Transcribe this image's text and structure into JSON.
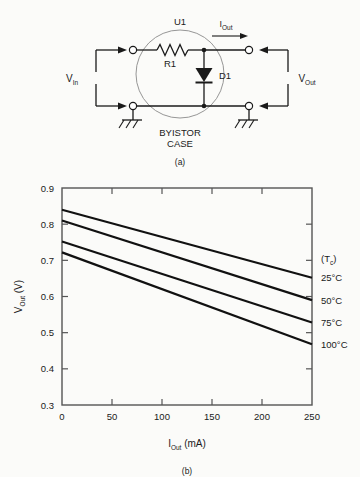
{
  "figure_a": {
    "caption": "(a)",
    "device_label": "U1",
    "case_label_line1": "BYISTOR",
    "case_label_line2": "CASE",
    "resistor_label": "R1",
    "diode_label": "D1",
    "input_label": "V",
    "input_sub": "In",
    "output_label": "V",
    "output_sub": "Out",
    "current_label": "I",
    "current_sub": "Out",
    "line_color": "#1a1a1a"
  },
  "figure_b": {
    "caption": "(b)"
  },
  "chart_data": {
    "type": "line",
    "title": "",
    "xlabel": "I_Out (mA)",
    "xlabel_main": "I",
    "xlabel_sub": "Out",
    "xlabel_unit": "(mA)",
    "ylabel": "V_Out (V)",
    "ylabel_main": "V",
    "ylabel_sub": "Out",
    "ylabel_unit": "(V)",
    "xlim": [
      0,
      250
    ],
    "ylim": [
      0.3,
      0.9
    ],
    "xticks": [
      0,
      50,
      100,
      150,
      200,
      250
    ],
    "xticklabels": [
      "0",
      "50",
      "100",
      "150",
      "200",
      "250"
    ],
    "yticks": [
      0.3,
      0.4,
      0.5,
      0.6,
      0.7,
      0.8,
      0.9
    ],
    "yticklabels": [
      "0.3",
      "0.4",
      "0.5",
      "0.6",
      "0.7",
      "0.8",
      "0.9"
    ],
    "grid": false,
    "legend_position": "right-outside",
    "legend_title": "(T",
    "legend_title_sub": "c",
    "legend_title_end": ")",
    "x": [
      0,
      250
    ],
    "series": [
      {
        "name": "25°C",
        "values": [
          0.84,
          0.652
        ],
        "legend_y": 0.652
      },
      {
        "name": "50°C",
        "values": [
          0.81,
          0.59
        ],
        "legend_y": 0.59
      },
      {
        "name": "75°C",
        "values": [
          0.752,
          0.528
        ],
        "legend_y": 0.528
      },
      {
        "name": "100°C",
        "values": [
          0.722,
          0.468
        ],
        "legend_y": 0.468
      }
    ],
    "line_color": "#111111",
    "axis_color": "#555555"
  }
}
